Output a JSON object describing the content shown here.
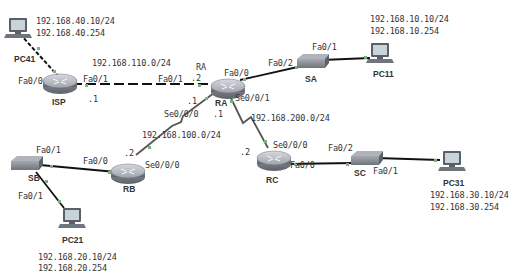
{
  "devices": {
    "pc41": {
      "name": "PC41",
      "ip": "192.168.40.10/24",
      "gateway": "192.168.40.254"
    },
    "pc11": {
      "name": "PC11",
      "ip": "192.168.10.10/24",
      "gateway": "192.168.10.254"
    },
    "pc21": {
      "name": "PC21",
      "ip": "192.168.20.10/24",
      "gateway": "192.168.20.254"
    },
    "pc31": {
      "name": "PC31",
      "ip": "192.168.30.10/24",
      "gateway": "192.168.30.254"
    },
    "isp": {
      "name": "ISP"
    },
    "ra": {
      "name": "RA",
      "name_alt": "RA"
    },
    "rb": {
      "name": "RB"
    },
    "rc": {
      "name": "RC"
    },
    "sa": {
      "name": "SA"
    },
    "sb": {
      "name": "SB"
    },
    "sc": {
      "name": "SC"
    }
  },
  "networks": {
    "isp_ra": "192.168.110.0/24",
    "ra_rb": "192.168.100.0/24",
    "ra_rc": "192.168.200.0/24"
  },
  "ports": {
    "isp_fa00": "Fa0/0",
    "isp_fa01": "Fa0/1",
    "isp_host": ".1",
    "ra_fa01": "Fa0/1",
    "ra_host_isp": ".2",
    "ra_fa00": "Fa0/0",
    "ra_se000": "Se0/0/0",
    "ra_se001": "Se0/0/1",
    "ra_host_rb": ".1",
    "ra_host_rc": ".1",
    "sa_fa02": "Fa0/2",
    "sa_fa01": "Fa0/1",
    "rb_fa00": "Fa0/0",
    "rb_se000": "Se0/0/0",
    "rb_host": ".2",
    "sb_fa01_top": "Fa0/1",
    "sb_fa01_bottom": "Fa0/1",
    "rc_se000": "Se0/0/0",
    "rc_fa00": "Fa0/0",
    "rc_host": ".2",
    "sc_fa02": "Fa0/2",
    "sc_fa01": "Fa0/1"
  },
  "colors": {
    "link": "#111111",
    "serial": "#555555",
    "port": "#7fb07f",
    "router_top": "#b8bcc4",
    "router_side": "#8a8f98",
    "switch": "#8c9199",
    "pc_screen": "#c8d4dc"
  }
}
